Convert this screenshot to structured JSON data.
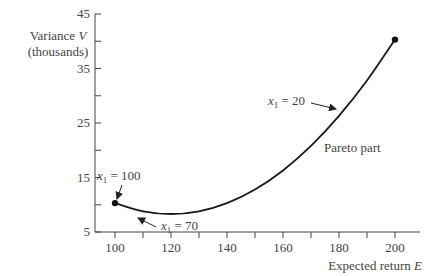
{
  "chart_data": {
    "type": "line",
    "title": "",
    "xlabel": "Expected return E",
    "ylabel_line1": "Variance V",
    "ylabel_line2": "(thousands)",
    "xlim": [
      95,
      210
    ],
    "ylim": [
      5,
      45
    ],
    "xticks": [
      100,
      120,
      140,
      160,
      180,
      200
    ],
    "xtick_labels": [
      "100",
      "120",
      "140",
      "160",
      "180",
      "200"
    ],
    "yticks": [
      5,
      15,
      25,
      35,
      45
    ],
    "ytick_labels": [
      "5",
      "15",
      "25",
      "35",
      "45"
    ],
    "grid": false,
    "series": [
      {
        "name": "Efficient frontier",
        "x": [
          100,
          110,
          120,
          130,
          140,
          150,
          160,
          170,
          180,
          190,
          200
        ],
        "y": [
          10.3,
          8.8,
          8.3,
          8.8,
          10.3,
          12.8,
          16.3,
          20.8,
          26.3,
          32.8,
          40.3
        ]
      }
    ],
    "endpoints": [
      {
        "x": 100,
        "y": 10.3
      },
      {
        "x": 200,
        "y": 40.3
      }
    ],
    "annotations": [
      {
        "label_var": "x",
        "label_sub": "1",
        "label_rest": " = 100",
        "points_to": {
          "x": 100,
          "y": 10.3
        }
      },
      {
        "label_var": "x",
        "label_sub": "1",
        "label_rest": " = 70",
        "points_to": {
          "x": 130,
          "y": 8.8
        }
      },
      {
        "label_var": "x",
        "label_sub": "1",
        "label_rest": " = 20",
        "points_to": {
          "x": 180,
          "y": 26.3
        }
      },
      {
        "text": "Pareto part"
      }
    ]
  }
}
